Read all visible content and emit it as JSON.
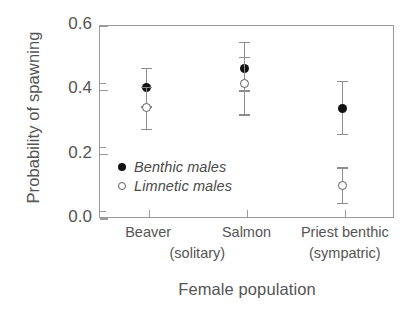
{
  "chart_data": {
    "type": "scatter",
    "title": "",
    "xlabel": "Female population",
    "ylabel": "Probability of spawning",
    "ylim": [
      0.0,
      0.6
    ],
    "grid": false,
    "legend_position": "inside-lower-left",
    "categories": [
      "Beaver",
      "Salmon",
      "Priest benthic"
    ],
    "category_sublabels": [
      "(solitary)",
      "",
      "(sympatric)"
    ],
    "group_bracket_note": "(solitary) spans Beaver and Salmon; (sympatric) under Priest benthic",
    "y_ticks_major": [
      "0.0",
      "0.2",
      "0.4",
      "0.6"
    ],
    "y_ticks_major_values": [
      0.0,
      0.2,
      0.4,
      0.6
    ],
    "y_ticks_minor_values": [
      0.1,
      0.3,
      0.5
    ],
    "series": [
      {
        "name": "Benthic males",
        "marker": "filled-circle",
        "color": "#121212",
        "values": [
          0.405,
          0.465,
          0.34
        ],
        "err_low": [
          0.345,
          0.395,
          0.26
        ],
        "err_high": [
          0.465,
          0.545,
          0.425
        ]
      },
      {
        "name": "Limnetic males",
        "marker": "open-circle",
        "color": "#5e5e5e",
        "values": [
          0.345,
          0.418,
          0.1
        ],
        "err_low": [
          0.275,
          0.32,
          0.045
        ],
        "err_high": [
          0.405,
          0.5,
          0.155
        ]
      }
    ]
  },
  "legend": {
    "items": [
      {
        "label": "Benthic males",
        "marker": "filled-circle"
      },
      {
        "label": "Limnetic males",
        "marker": "open-circle"
      }
    ]
  },
  "axes": {
    "y_title": "Probability of spawning",
    "x_title": "Female population",
    "y_tick_labels": [
      "0.6",
      "0.4",
      "0.2",
      "0.0"
    ],
    "x_tick_labels": [
      "Beaver",
      "Salmon",
      "Priest benthic"
    ],
    "x_tick_sublabels": [
      "(solitary)",
      "(sympatric)"
    ]
  },
  "colors": {
    "benthic_marker": "#121212",
    "limnetic_marker": "#5e5e5e",
    "errorbar": "#8d8d8d",
    "frame": "#9a9a9a",
    "text": "#555555",
    "background": "#ffffff"
  }
}
